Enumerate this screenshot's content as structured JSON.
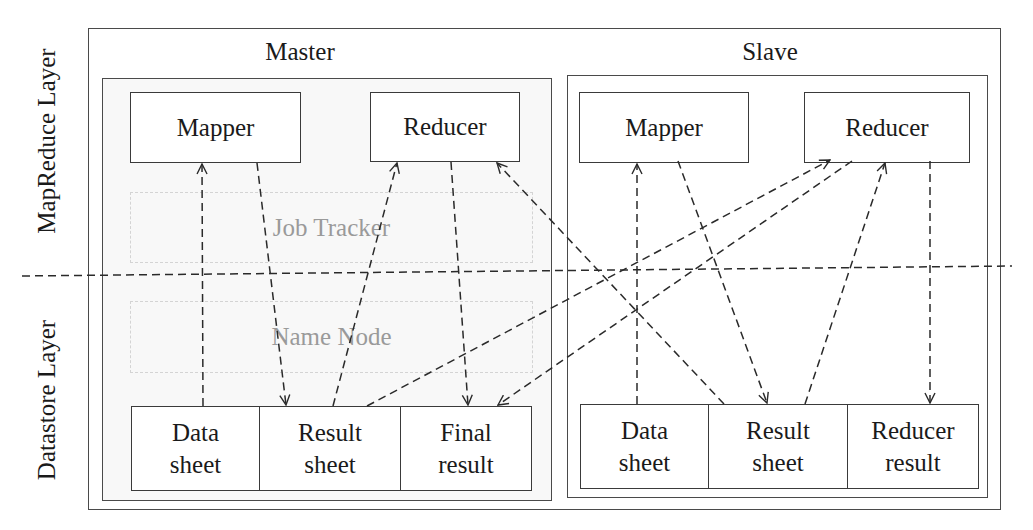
{
  "layers": {
    "top": "MapReduce Layer",
    "bottom": "Datastore Layer"
  },
  "master": {
    "title": "Master",
    "mapper": "Mapper",
    "reducer": "Reducer",
    "job_tracker": "Job Tracker",
    "name_node": "Name Node",
    "store": [
      {
        "line1": "Data",
        "line2": "sheet"
      },
      {
        "line1": "Result",
        "line2": "sheet"
      },
      {
        "line1": "Final",
        "line2": "result"
      }
    ]
  },
  "slave": {
    "title": "Slave",
    "mapper": "Mapper",
    "reducer": "Reducer",
    "store": [
      {
        "line1": "Data",
        "line2": "sheet"
      },
      {
        "line1": "Result",
        "line2": "sheet"
      },
      {
        "line1": "Reducer",
        "line2": "result"
      }
    ]
  },
  "edges": [
    {
      "from": "master.data_sheet",
      "to": "master.mapper"
    },
    {
      "from": "master.mapper",
      "to": "master.result_sheet"
    },
    {
      "from": "master.result_sheet",
      "to": "master.reducer"
    },
    {
      "from": "master.reducer",
      "to": "master.final_result"
    },
    {
      "from": "master.result_sheet",
      "to": "slave.reducer"
    },
    {
      "from": "slave.reducer",
      "to": "master.final_result"
    },
    {
      "from": "slave.result_sheet",
      "to": "master.reducer"
    },
    {
      "from": "slave.data_sheet",
      "to": "slave.mapper"
    },
    {
      "from": "slave.mapper",
      "to": "slave.result_sheet"
    },
    {
      "from": "slave.result_sheet",
      "to": "slave.reducer"
    },
    {
      "from": "slave.reducer",
      "to": "slave.reducer_result"
    }
  ],
  "style": {
    "line_color": "#2a2a2a",
    "ghost_text_color": "#9a9a9a"
  }
}
